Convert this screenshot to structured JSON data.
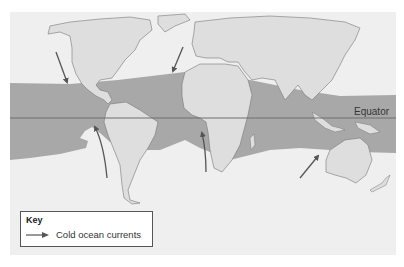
{
  "map": {
    "colors": {
      "background": "#ffffff",
      "ocean": "#efefef",
      "land": "#dedede",
      "tropical_band": "#a8a8a8",
      "coast": "#777777",
      "equator_line": "#6e6e6e",
      "arrow": "#555555"
    },
    "labels": {
      "equator": "Equator"
    },
    "arrows_description": "Cold ocean currents flowing toward the equator",
    "arrows": [
      {
        "name": "california-current",
        "from": [
          56,
          52
        ],
        "to": [
          67,
          82
        ]
      },
      {
        "name": "canary-current",
        "from": [
          183,
          47
        ],
        "to": [
          173,
          71
        ]
      },
      {
        "name": "humboldt-current",
        "from": [
          107,
          178
        ],
        "to": [
          95,
          127
        ]
      },
      {
        "name": "benguela-current",
        "from": [
          206,
          172
        ],
        "to": [
          202,
          133
        ]
      },
      {
        "name": "west-australian-current",
        "from": [
          300,
          178
        ],
        "to": [
          318,
          156
        ]
      }
    ]
  },
  "key": {
    "title": "Key",
    "items": [
      {
        "symbol": "arrow-icon",
        "label": "Cold ocean currents"
      }
    ]
  }
}
